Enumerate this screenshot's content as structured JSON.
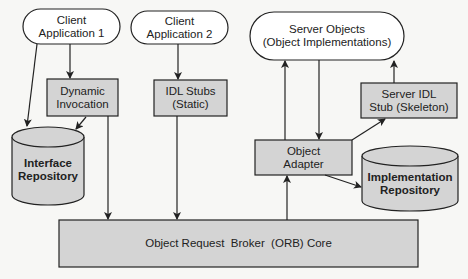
{
  "diagram": {
    "colors": {
      "background": "#f7f7f5",
      "box_fill": "#d4d4d4",
      "pill_fill": "#ffffff",
      "stroke": "#222222"
    },
    "nodes": {
      "client_app_1": {
        "label": "Client\nApplication 1",
        "shape": "pill"
      },
      "client_app_2": {
        "label": "Client\nApplication 2",
        "shape": "pill"
      },
      "dynamic_invocation": {
        "label": "Dynamic\nInvocation",
        "shape": "box"
      },
      "idl_stubs": {
        "label": "IDL Stubs\n(Static)",
        "shape": "box"
      },
      "server_objects": {
        "label": "Server Objects\n(Object Implementations)",
        "shape": "pill"
      },
      "server_idl_stub": {
        "label": "Server IDL\nStub (Skeleton)",
        "shape": "box"
      },
      "object_adapter": {
        "label": "Object\nAdapter",
        "shape": "box"
      },
      "interface_repository": {
        "label": "Interface\nRepository",
        "shape": "cylinder"
      },
      "implementation_repository": {
        "label": "Implementation\nRepository",
        "shape": "cylinder"
      },
      "orb_core": {
        "label": "Object Request  Broker  (ORB) Core",
        "shape": "box"
      }
    },
    "edges": [
      {
        "from": "client_app_1",
        "to": "dynamic_invocation"
      },
      {
        "from": "client_app_1",
        "to": "interface_repository"
      },
      {
        "from": "dynamic_invocation",
        "to": "interface_repository"
      },
      {
        "from": "dynamic_invocation",
        "to": "orb_core"
      },
      {
        "from": "client_app_2",
        "to": "idl_stubs"
      },
      {
        "from": "idl_stubs",
        "to": "orb_core"
      },
      {
        "from": "orb_core",
        "to": "object_adapter"
      },
      {
        "from": "object_adapter",
        "to": "server_objects"
      },
      {
        "from": "server_objects",
        "to": "object_adapter"
      },
      {
        "from": "object_adapter",
        "to": "server_idl_stub"
      },
      {
        "from": "server_idl_stub",
        "to": "server_objects"
      },
      {
        "from": "object_adapter",
        "to": "implementation_repository"
      }
    ]
  }
}
